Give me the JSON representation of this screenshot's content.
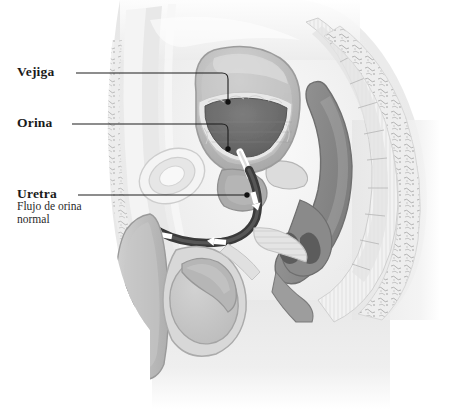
{
  "image": {
    "kind": "medical-illustration",
    "subject": "Anatomia sagital masculina - flujo de orina normal",
    "width": 474,
    "height": 409,
    "background_color": "#ffffff"
  },
  "labels": {
    "bladder": {
      "text": "Vejiga",
      "leader": {
        "x1": 76,
        "y1": 73,
        "x2": 228,
        "y2": 73,
        "x3": 228,
        "y3": 101,
        "dot_x": 228,
        "dot_y": 103
      }
    },
    "urine": {
      "text": "Orina",
      "leader": {
        "x1": 72,
        "y1": 124,
        "x2": 228,
        "y2": 124,
        "x3": 228,
        "y3": 148,
        "dot_x": 228,
        "dot_y": 150
      }
    },
    "urethra": {
      "text": "Uretra",
      "subtitle_line1": "Flujo de orina",
      "subtitle_line2": "normal",
      "leader": {
        "x1": 78,
        "y1": 195,
        "x2": 247,
        "y2": 195,
        "dot_x": 247,
        "dot_y": 195
      }
    }
  },
  "anatomy": {
    "parts": [
      {
        "name": "body-outline",
        "label": "Contorno del cuerpo",
        "color": "#e9e9e9"
      },
      {
        "name": "abdominal-wall",
        "label": "Pared abdominal",
        "color": "#ededed"
      },
      {
        "name": "bladder",
        "label": "Vejiga",
        "color": "#b9b9b9"
      },
      {
        "name": "urine",
        "label": "Orina",
        "color": "#6e6e6e"
      },
      {
        "name": "bladder-lining",
        "label": "Mucosa vesical",
        "color": "#e4e4e4"
      },
      {
        "name": "prostate",
        "label": "Prostata",
        "color": "#a9a9a9"
      },
      {
        "name": "urethra",
        "label": "Uretra",
        "color": "#2e2e2e"
      },
      {
        "name": "rectum",
        "label": "Recto",
        "color": "#8e8e8e"
      },
      {
        "name": "sacrum",
        "label": "Sacro",
        "color": "#dedede"
      },
      {
        "name": "penis",
        "label": "Pene",
        "color": "#bdbdbd"
      },
      {
        "name": "testicle",
        "label": "Testiculo",
        "color": "#c4c4c4"
      },
      {
        "name": "pubic-bone",
        "label": "Hueso pubico",
        "color": "#f0f0f0"
      }
    ],
    "flow_markers": {
      "count": 4,
      "color": "#ffffff",
      "direction": "hacia-abajo-y-afuera"
    }
  },
  "palette": {
    "ink": "#1a1a1a",
    "leader_line": "#1d1d1d",
    "urine_dark": "#6e6e6e",
    "urethra_dark": "#2e2e2e",
    "tissue_light": "#ededed",
    "tissue_mid": "#c8c8c8",
    "tissue_dark": "#8e8e8e"
  }
}
